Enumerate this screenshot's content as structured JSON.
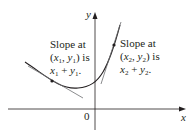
{
  "diagram": {
    "type": "direction-field-curve",
    "axes": {
      "x_label": "x",
      "y_label": "y",
      "origin_label": "0"
    },
    "annotations": [
      {
        "id": "point1",
        "line1": "Slope at",
        "line2_open": "(",
        "line2_var1": "x",
        "line2_sub1": "1",
        "line2_sep": ", ",
        "line2_var2": "y",
        "line2_sub2": "1",
        "line2_close": ") is",
        "line3_var1": "x",
        "line3_sub1": "1",
        "line3_plus": " + ",
        "line3_var2": "y",
        "line3_sub2": "1",
        "line3_end": "."
      },
      {
        "id": "point2",
        "line1": "Slope at",
        "line2_open": "(",
        "line2_var1": "x",
        "line2_sub1": "2",
        "line2_sep": ", ",
        "line2_var2": "y",
        "line2_sub2": "2",
        "line2_close": ") is",
        "line3_var1": "x",
        "line3_sub1": "2",
        "line3_plus": " + ",
        "line3_var2": "y",
        "line3_sub2": "2",
        "line3_end": "."
      }
    ],
    "colors": {
      "curve": "#231f20",
      "tangent": "#6d6e71",
      "axis": "#231f20",
      "text": "#231f20"
    }
  }
}
